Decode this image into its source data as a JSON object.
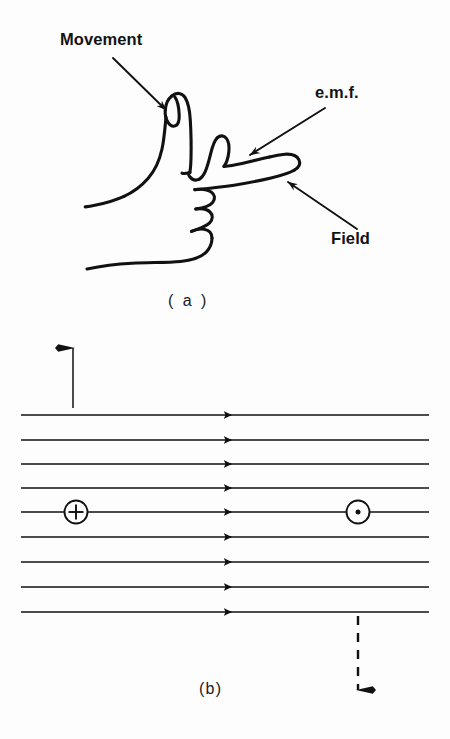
{
  "figure": {
    "background_color": "#fdfdfd",
    "ink_color": "#111111",
    "panels": [
      {
        "id": "a",
        "caption": "( a )",
        "subject": "right hand showing Fleming's right-hand rule",
        "labels": [
          {
            "name": "movement",
            "text": "Movement",
            "pointer": "arrow from label down-right to thumb tip"
          },
          {
            "name": "emf",
            "text": "e.m.f.",
            "pointer": "arrow from label down-left to middle finger"
          },
          {
            "name": "field",
            "text": "Field",
            "pointer": "arrow from label up-left to index finger tip"
          }
        ]
      },
      {
        "id": "b",
        "caption": "(b)",
        "subject": "horizontal magnetic field lines with conductor motion arrows",
        "field_lines": {
          "count": 9,
          "direction": "left to right",
          "arrow_marker_x": 225,
          "x_start": 21,
          "x_end": 429,
          "y_positions": [
            415,
            440,
            464,
            488,
            512,
            537,
            562,
            587,
            612
          ]
        },
        "markers": [
          {
            "name": "current-into-page",
            "symbol": "plus-in-circle",
            "glyph": "⊕",
            "x": 76,
            "y": 512
          },
          {
            "name": "current-out-of-page",
            "symbol": "dot-in-circle",
            "glyph": "⊙",
            "x": 358,
            "y": 512
          }
        ],
        "motion_arrows": [
          {
            "name": "up-arrow-solid",
            "direction": "up",
            "style": "solid",
            "x": 73,
            "y_tail": 408,
            "y_head": 348
          },
          {
            "name": "down-arrow-dashed",
            "direction": "down",
            "style": "dashed",
            "x": 358,
            "y_tail": 616,
            "y_head": 690
          }
        ]
      }
    ]
  }
}
